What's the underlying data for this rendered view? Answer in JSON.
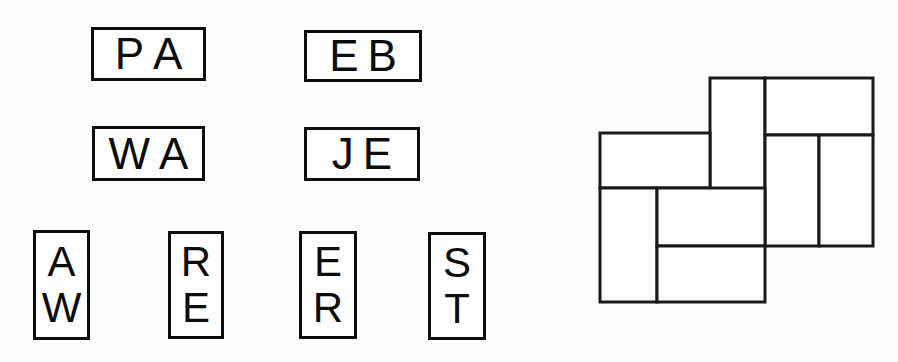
{
  "page": {
    "width": 898,
    "height": 362,
    "background_color": "#fdfdfd",
    "ink_color": "#0d0d0d"
  },
  "letter_tiles": {
    "horizontal": [
      {
        "id": "tile-pa",
        "letters": [
          "P",
          "A"
        ],
        "text": "PA",
        "x": 91,
        "y": 27,
        "width": 115,
        "height": 54
      },
      {
        "id": "tile-eb",
        "letters": [
          "E",
          "B"
        ],
        "text": "EB",
        "x": 304,
        "y": 30,
        "width": 118,
        "height": 52
      },
      {
        "id": "tile-wa",
        "letters": [
          "W",
          "A"
        ],
        "text": "WA",
        "x": 92,
        "y": 126,
        "width": 113,
        "height": 55
      },
      {
        "id": "tile-je",
        "letters": [
          "J",
          "E"
        ],
        "text": "JE",
        "x": 304,
        "y": 127,
        "width": 116,
        "height": 54
      }
    ],
    "vertical": [
      {
        "id": "tile-aw",
        "letters": [
          "A",
          "W"
        ],
        "text": "AW",
        "x": 33,
        "y": 230,
        "width": 57,
        "height": 110
      },
      {
        "id": "tile-re",
        "letters": [
          "R",
          "E"
        ],
        "text": "RE",
        "x": 168,
        "y": 231,
        "width": 56,
        "height": 108
      },
      {
        "id": "tile-er",
        "letters": [
          "E",
          "R"
        ],
        "text": "ER",
        "x": 299,
        "y": 231,
        "width": 58,
        "height": 108
      },
      {
        "id": "tile-st",
        "letters": [
          "S",
          "T"
        ],
        "text": "ST",
        "x": 428,
        "y": 232,
        "width": 58,
        "height": 108
      }
    ]
  },
  "tiling_figure": {
    "id": "rectangle-tiling",
    "x": 598,
    "y": 76,
    "width": 280,
    "height": 230,
    "view_box": "0 0 280 230",
    "stroke_color": "#1a1a1a",
    "fill_color": "#ffffff",
    "rectangles": [
      {
        "id": "rect-top-tall",
        "x": 112,
        "y": 2,
        "width": 55,
        "height": 115
      },
      {
        "id": "rect-top-right",
        "x": 167,
        "y": 2,
        "width": 108,
        "height": 57
      },
      {
        "id": "rect-left-upper",
        "x": 2,
        "y": 57,
        "width": 110,
        "height": 55
      },
      {
        "id": "rect-right-inner",
        "x": 167,
        "y": 59,
        "width": 54,
        "height": 111
      },
      {
        "id": "rect-right-outer",
        "x": 221,
        "y": 59,
        "width": 54,
        "height": 111
      },
      {
        "id": "rect-left-lower",
        "x": 2,
        "y": 112,
        "width": 57,
        "height": 114
      },
      {
        "id": "rect-mid-middle",
        "x": 59,
        "y": 112,
        "width": 108,
        "height": 58
      },
      {
        "id": "rect-bottom-mid",
        "x": 59,
        "y": 170,
        "width": 108,
        "height": 56
      }
    ]
  }
}
